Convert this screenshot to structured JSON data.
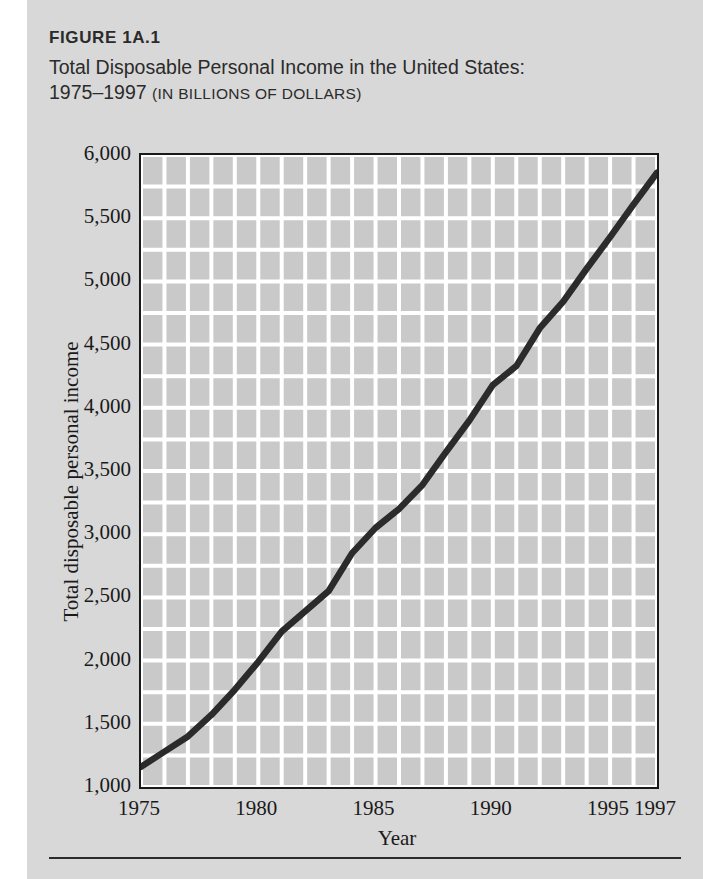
{
  "figure": {
    "number": "FIGURE 1A.1",
    "title_line1": "Total Disposable Personal Income in the United States:",
    "title_line2_years": "1975–1997 ",
    "title_line2_units": "(IN BILLIONS OF DOLLARS)"
  },
  "colors": {
    "page_background": "#d8d8d8",
    "plot_background": "#c9c9c9",
    "gridline": "#ffffff",
    "axis_frame": "#1a1a1a",
    "data_line": "#2b2b2b",
    "text": "#2b2b2b"
  },
  "axis": {
    "y_ticks": [
      "6,000",
      "5,500",
      "5,000",
      "4,500",
      "4,000",
      "3,500",
      "3,000",
      "2,500",
      "2,000",
      "1,500",
      "1,000"
    ],
    "x_ticks": [
      "1975",
      "1980",
      "1985",
      "1990",
      "1995",
      "1997"
    ],
    "x_title": "Year",
    "y_title": "Total disposable personal income"
  },
  "chart_data": {
    "type": "line",
    "title": "Total Disposable Personal Income in the United States: 1975–1997 (in billions of dollars)",
    "xlabel": "Year",
    "ylabel": "Total disposable personal income",
    "xlim": [
      1975,
      1997
    ],
    "ylim": [
      1000,
      6000
    ],
    "y_tick_values": [
      1000,
      1500,
      2000,
      2500,
      3000,
      3500,
      4000,
      4500,
      5000,
      5500,
      6000
    ],
    "x_tick_values": [
      1975,
      1980,
      1985,
      1990,
      1995,
      1997
    ],
    "grid": true,
    "grid_x_step": 1,
    "grid_y_step": 250,
    "legend": "none",
    "x": [
      1975,
      1976,
      1977,
      1978,
      1979,
      1980,
      1981,
      1982,
      1983,
      1984,
      1985,
      1986,
      1987,
      1988,
      1989,
      1990,
      1991,
      1992,
      1993,
      1994,
      1995,
      1996,
      1997
    ],
    "series": [
      {
        "name": "Total disposable personal income",
        "values": [
          1160,
          1280,
          1400,
          1570,
          1770,
          1990,
          2230,
          2390,
          2550,
          2850,
          3050,
          3200,
          3390,
          3650,
          3900,
          4180,
          4330,
          4630,
          4840,
          5100,
          5350,
          5610,
          5860
        ]
      }
    ]
  }
}
